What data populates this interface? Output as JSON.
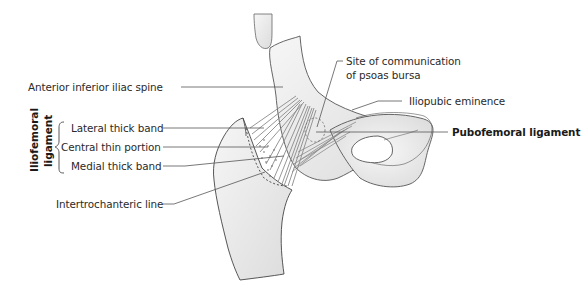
{
  "figure": {
    "colors": {
      "bone_fill": "#e9e9e9",
      "bone_outline": "#555555",
      "ligament_fibers": "#8a8a8a",
      "leader_line": "#555555",
      "text": "#2a2a2a"
    }
  },
  "labels": {
    "anterior_inferior_iliac_spine": "Anterior inferior iliac spine",
    "site_of_communication_line1": "Site of communication",
    "site_of_communication_line2": "of psoas bursa",
    "iliopubic_eminence": "Iliopubic eminence",
    "pubofemoral_ligament": "Pubofemoral ligament",
    "iliofemoral_group_line1": "Iliofemoral",
    "iliofemoral_group_line2": "ligament",
    "lateral_thick_band": "Lateral thick band",
    "central_thin_portion": "Central thin portion",
    "medial_thick_band": "Medial thick band",
    "intertrochanteric_line": "Intertrochanteric line"
  }
}
